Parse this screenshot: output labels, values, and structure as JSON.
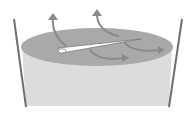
{
  "diagram": {
    "elements": [
      "container-walls",
      "liquid-body",
      "liquid-surface",
      "floating-needle",
      "flow-arrows"
    ],
    "colors": {
      "wall": "#6f6f6f",
      "liquid_body": "#dcdcdc",
      "liquid_surface": "#a9a9a9",
      "arrow": "#8a8a8a",
      "needle": "#ffffff",
      "needle_outline": "#7a7a7a"
    }
  }
}
